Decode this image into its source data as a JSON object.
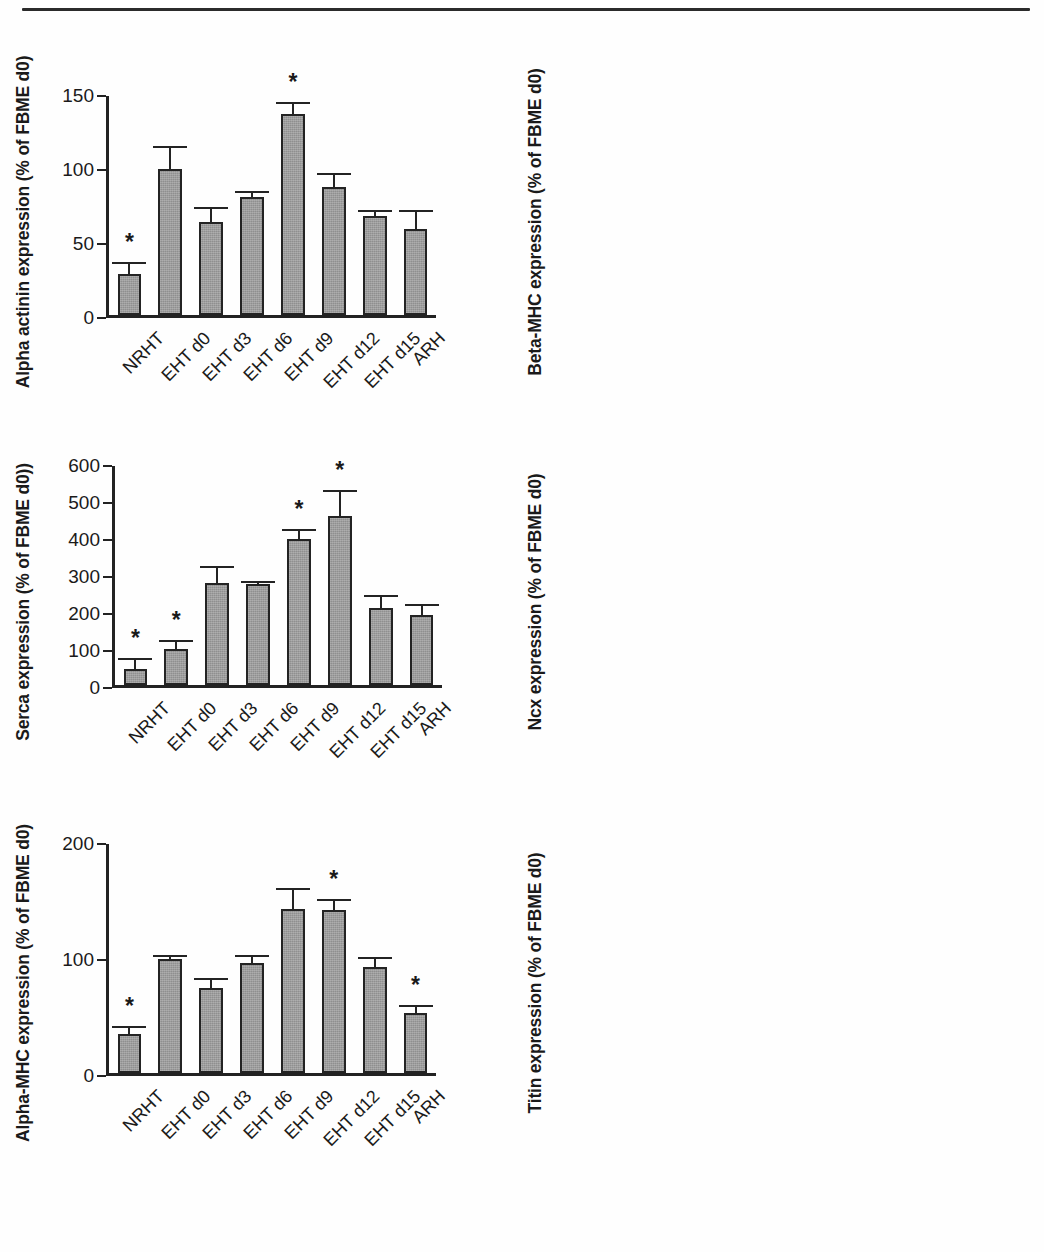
{
  "figure": {
    "categories": [
      "NRHT",
      "EHT d0",
      "EHT d3",
      "EHT d6",
      "EHT d9",
      "EHT d12",
      "EHT d15",
      "ARH"
    ],
    "significance_marker": "*",
    "bar_fill_color": "#9d9d9d",
    "bar_edge_color": "#232323",
    "axis_color": "#222222"
  },
  "chart_data": [
    {
      "type": "bar",
      "panel": "top-left",
      "title": "",
      "ylabel": "Alpha actinin expression (% of FBME d0)",
      "xlabel": "",
      "categories": [
        "NRHT",
        "EHT d0",
        "EHT d3",
        "EHT d6",
        "EHT d9",
        "EHT d12",
        "EHT d15",
        "ARH"
      ],
      "values": [
        28,
        100,
        64,
        81,
        138,
        88,
        68,
        59
      ],
      "errors": [
        8,
        16,
        10,
        4,
        8,
        9,
        4,
        13
      ],
      "significant": [
        true,
        false,
        false,
        false,
        true,
        false,
        false,
        false
      ],
      "ylim": [
        0,
        150
      ],
      "yticks": [
        0,
        50,
        100,
        150
      ],
      "ytick_labels": [
        "0",
        "50",
        "100",
        "150"
      ],
      "grid": false,
      "legend": "none"
    },
    {
      "type": "bar",
      "panel": "top-right",
      "title": "",
      "ylabel": "Beta-MHC expression (% of FBME d0)",
      "xlabel": "",
      "categories": [
        "NRHT",
        "EHT d0",
        "EHT d3",
        "EHT d6",
        "EHT d9",
        "EHT d12",
        "EHT d15",
        "ARH"
      ],
      "values": [
        42,
        100,
        36,
        34,
        243,
        253,
        206,
        14
      ],
      "errors": [
        16,
        21,
        6,
        2,
        34,
        50,
        20,
        6
      ],
      "significant": [
        true,
        true,
        true,
        true,
        false,
        false,
        false,
        true
      ],
      "ylim": [
        0,
        350
      ],
      "yticks": [
        0,
        50,
        100,
        150,
        200,
        250,
        300,
        350
      ],
      "ytick_labels": [
        "0",
        "50",
        "100",
        "150",
        "200",
        "250",
        "300",
        "350"
      ],
      "grid": false,
      "legend": "none"
    },
    {
      "type": "bar",
      "panel": "middle-left",
      "title": "",
      "ylabel": "Serca expression (% of FBME d0))",
      "xlabel": "",
      "categories": [
        "NRHT",
        "EHT d0",
        "EHT d3",
        "EHT d6",
        "EHT d9",
        "EHT d12",
        "EHT d15",
        "ARH"
      ],
      "values": [
        43,
        100,
        280,
        278,
        400,
        462,
        212,
        192
      ],
      "errors": [
        32,
        23,
        45,
        8,
        28,
        72,
        35,
        30
      ],
      "significant": [
        true,
        true,
        false,
        false,
        true,
        true,
        false,
        false
      ],
      "ylim": [
        0,
        600
      ],
      "yticks": [
        0,
        100,
        200,
        300,
        400,
        500,
        600
      ],
      "ytick_labels": [
        "0",
        "100",
        "200",
        "300",
        "400",
        "500",
        "600"
      ],
      "grid": false,
      "legend": "none"
    },
    {
      "type": "bar",
      "panel": "middle-right",
      "title": "",
      "ylabel": "Ncx expression (% of FBME d0)",
      "xlabel": "",
      "categories": [
        "NRHT",
        "EHT d0",
        "EHT d3",
        "EHT d6",
        "EHT d9",
        "EHT d12",
        "EHT d15",
        "ARH"
      ],
      "values": [
        135,
        100,
        89,
        131,
        143,
        172,
        153,
        79
      ],
      "errors": [
        28,
        13,
        12,
        4,
        17,
        9,
        5,
        12
      ],
      "significant": [
        true,
        true,
        true,
        true,
        false,
        false,
        false,
        true
      ],
      "ylim": [
        0,
        200
      ],
      "yticks": [
        0,
        100,
        200
      ],
      "ytick_labels": [
        "0",
        "100",
        "200"
      ],
      "grid": false,
      "legend": "none"
    },
    {
      "type": "bar",
      "panel": "bottom-left",
      "title": "",
      "ylabel": "Alpha-MHC expression (% of FBME d0)",
      "xlabel": "",
      "categories": [
        "NRHT",
        "EHT d0",
        "EHT d3",
        "EHT d6",
        "EHT d9",
        "EHT d12",
        "EHT d15",
        "ARH"
      ],
      "values": [
        34,
        100,
        74,
        96,
        143,
        142,
        93,
        52
      ],
      "errors": [
        7,
        3,
        9,
        7,
        19,
        10,
        8,
        7
      ],
      "significant": [
        true,
        false,
        false,
        false,
        false,
        true,
        false,
        true
      ],
      "ylim": [
        0,
        200
      ],
      "yticks": [
        0,
        100,
        200
      ],
      "ytick_labels": [
        "0",
        "100",
        "200"
      ],
      "grid": false,
      "legend": "none"
    },
    {
      "type": "bar",
      "panel": "bottom-right",
      "title": "",
      "ylabel": "Titin expression (% of FBME d0)",
      "xlabel": "",
      "categories": [
        "NRHT",
        "EHT d0",
        "EHT d3",
        "EHT d6",
        "EHT d9",
        "EHT d12",
        "EHT d15",
        "ARH"
      ],
      "values": [
        94,
        100,
        93,
        102,
        199,
        174,
        136,
        18
      ],
      "errors": [
        17,
        12,
        12,
        6,
        40,
        28,
        10,
        12
      ],
      "significant": [
        false,
        false,
        true,
        true,
        false,
        false,
        false,
        true
      ],
      "ylim": [
        0,
        250
      ],
      "yticks": [
        0,
        50,
        100,
        150,
        200,
        250
      ],
      "ytick_labels": [
        "0",
        "50",
        "100",
        "150",
        "200",
        "250"
      ],
      "grid": false,
      "legend": "none"
    }
  ]
}
